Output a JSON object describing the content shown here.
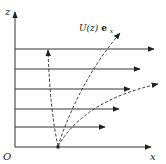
{
  "diagram": {
    "axes": {
      "z_label": "z",
      "x_label": "x",
      "origin_label": "O"
    },
    "velocity_label": "U(z)",
    "velocity_vector": "e",
    "velocity_subscript": "x",
    "flow_arrows": [
      {
        "y": 49,
        "x_end": 154
      },
      {
        "y": 69,
        "x_end": 140
      },
      {
        "y": 89,
        "x_end": 130
      },
      {
        "y": 109,
        "x_end": 119
      },
      {
        "y": 127,
        "x_end": 105
      }
    ],
    "colors": {
      "line": "#333333",
      "background": "#ffffff"
    }
  }
}
